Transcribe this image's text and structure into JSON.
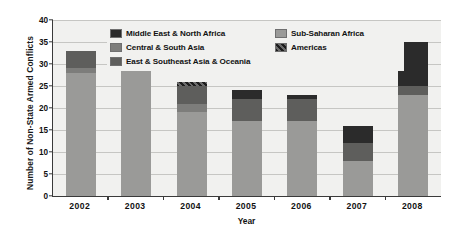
{
  "chart_data": {
    "type": "bar",
    "stacked": true,
    "title": "",
    "xlabel": "Year",
    "ylabel": "Number of Non-State Armed Conflicts",
    "categories": [
      "2002",
      "2003",
      "2004",
      "2005",
      "2006",
      "2007",
      "2008"
    ],
    "ylim": [
      0,
      40
    ],
    "yticks": [
      0,
      5,
      10,
      15,
      20,
      25,
      30,
      35,
      40
    ],
    "ytick_labels": [
      "0",
      "5",
      "10",
      "15",
      "20",
      "25",
      "30",
      "35",
      "40"
    ],
    "grid": true,
    "legend_position": "upper-center-inside",
    "series": [
      {
        "name": "Sub-Saharan Africa",
        "color": "#9a9a98",
        "values": [
          28,
          29,
          19,
          17,
          17,
          8,
          23
        ]
      },
      {
        "name": "Central & South Asia",
        "color": "#7d7d7b",
        "values": [
          1,
          0,
          2,
          0,
          0,
          0,
          0
        ]
      },
      {
        "name": "East & Southeast Asia & Oceania",
        "color": "#5e5e5c",
        "values": [
          4,
          5,
          4,
          5,
          5,
          4,
          2
        ]
      },
      {
        "name": "Middle East & North Africa",
        "color": "#2b2b2b",
        "values": [
          0,
          0,
          0,
          2,
          1,
          4,
          10
        ]
      },
      {
        "name": "Americas",
        "color": "#3f3f3f",
        "pattern": "checker",
        "values": [
          0,
          0,
          1,
          0,
          0,
          0,
          0
        ]
      }
    ],
    "totals": [
      33,
      34,
      26,
      24,
      23,
      16,
      35
    ]
  },
  "legend": {
    "entries": [
      {
        "label": "Middle East & North Africa",
        "color": "#2b2b2b"
      },
      {
        "label": "Sub-Saharan Africa",
        "color": "#9a9a98"
      },
      {
        "label": "Central & South Asia",
        "color": "#7d7d7b"
      },
      {
        "label": "Americas",
        "color": "#3f3f3f"
      },
      {
        "label": "East & Southeast Asia & Oceania",
        "color": "#5e5e5c"
      }
    ]
  },
  "axes": {
    "y_title": "Number of Non-State Armed Conflicts",
    "x_title": "Year"
  }
}
